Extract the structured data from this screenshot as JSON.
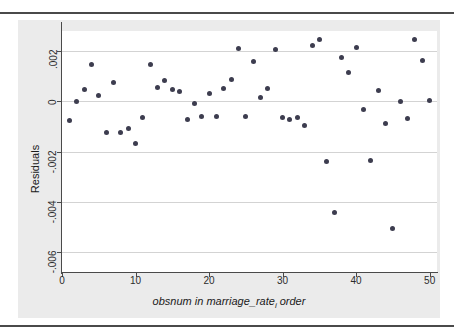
{
  "page": {
    "background": "#ffffff",
    "figure_background": "#ebebeb",
    "plot_background": "#ffffff",
    "rule_color": "#4a4a4a",
    "marker_color": "#3d3d4f",
    "gridline_color": "#d3d3d3"
  },
  "chart_data": {
    "type": "scatter",
    "title": "",
    "xlabel": "obsnum in marriage_rate",
    "xlabel_sub": "i",
    "xlabel_suffix": " order",
    "ylabel": "Residuals",
    "xlim": [
      0,
      51
    ],
    "ylim": [
      -0.0068,
      0.0028
    ],
    "grid": true,
    "grid_axis": "y",
    "legend": "none",
    "xticks": [
      0,
      10,
      20,
      30,
      40,
      50
    ],
    "xtick_labels": [
      "0",
      "10",
      "20",
      "30",
      "40",
      "50"
    ],
    "yticks": [
      0.002,
      0,
      -0.002,
      -0.004,
      -0.006
    ],
    "ytick_labels": [
      ".002",
      "0",
      "-.002",
      "-.004",
      "-.006"
    ],
    "x": [
      1,
      2,
      3,
      4,
      5,
      6,
      7,
      8,
      9,
      10,
      11,
      12,
      13,
      14,
      15,
      16,
      17,
      18,
      19,
      20,
      21,
      22,
      23,
      24,
      25,
      26,
      27,
      28,
      29,
      30,
      31,
      32,
      33,
      34,
      35,
      36,
      37,
      38,
      39,
      40,
      41,
      42,
      43,
      44,
      45,
      46,
      47,
      48,
      49,
      50
    ],
    "y": [
      -0.00075,
      1e-05,
      0.00047,
      0.00145,
      0.00024,
      -0.00123,
      0.00076,
      -0.00124,
      -0.00107,
      -0.00167,
      -0.00063,
      0.00147,
      0.00056,
      0.00081,
      0.00048,
      0.00039,
      -0.00072,
      -8e-05,
      -0.00061,
      0.00031,
      -0.00059,
      0.00052,
      0.00085,
      0.00211,
      -0.00062,
      0.00157,
      0.00016,
      0.00052,
      0.00206,
      -0.00064,
      -0.00071,
      -0.00066,
      -0.00096,
      0.00221,
      0.00247,
      -0.00238,
      -0.00441,
      0.00173,
      0.00113,
      0.00216,
      -0.00032,
      -0.00237,
      0.00044,
      -0.00088,
      -0.00506,
      -1e-05,
      -0.00069,
      0.00245,
      0.00162,
      5e-05
    ],
    "n_points": 50
  }
}
